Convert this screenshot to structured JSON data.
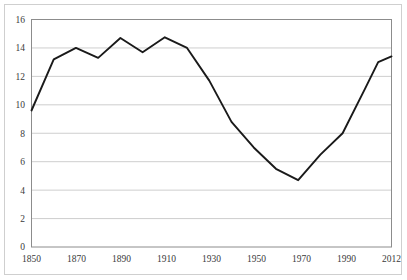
{
  "chart_data": {
    "type": "line",
    "title": "",
    "subtitle": "",
    "xlabel": "",
    "ylabel": "",
    "xlim": [
      1850,
      2012
    ],
    "ylim": [
      0,
      16
    ],
    "grid": true,
    "grid_axis": "y",
    "legend": false,
    "legend_position": "none",
    "line_color": "#1a1a1a",
    "grid_color": "#c8c8c8",
    "border_color": "#8c8c8c",
    "background_color": "#ffffff",
    "ytick_labels": [
      "0",
      "2",
      "4",
      "6",
      "8",
      "10",
      "12",
      "14",
      "16"
    ],
    "ytick_values": [
      0,
      2,
      4,
      6,
      8,
      10,
      12,
      14,
      16
    ],
    "xtick_labels": [
      "1850",
      "1870",
      "1890",
      "1910",
      "1930",
      "1950",
      "1970",
      "1990",
      "2012"
    ],
    "xtick_values": [
      1850,
      1870,
      1890,
      1910,
      1930,
      1950,
      1970,
      1990,
      2012
    ],
    "x": [
      1850,
      1860,
      1870,
      1880,
      1890,
      1900,
      1910,
      1920,
      1930,
      1940,
      1950,
      1960,
      1970,
      1980,
      1990,
      2000,
      2006,
      2012
    ],
    "values": [
      9.6,
      13.2,
      14.0,
      13.3,
      14.7,
      13.7,
      14.75,
      14.0,
      11.7,
      8.8,
      7.0,
      5.5,
      4.7,
      6.5,
      8.0,
      11.1,
      13.0,
      13.4
    ],
    "series": [
      {
        "name": "series-1",
        "values": [
          9.6,
          13.2,
          14.0,
          13.3,
          14.7,
          13.7,
          14.75,
          14.0,
          11.7,
          8.8,
          7.0,
          5.5,
          4.7,
          6.5,
          8.0,
          11.1,
          13.0,
          13.4
        ]
      }
    ],
    "annotations": []
  }
}
